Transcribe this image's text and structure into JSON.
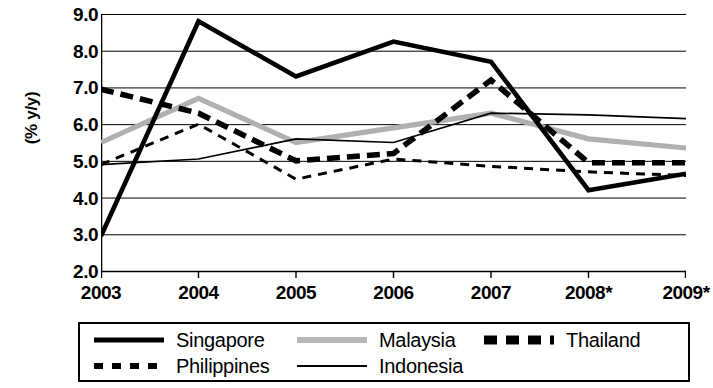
{
  "chart_data": {
    "type": "line",
    "title": "",
    "xlabel": "",
    "ylabel": "(% y/y)",
    "categories": [
      "2003",
      "2004",
      "2005",
      "2006",
      "2007",
      "2008*",
      "2009*"
    ],
    "ylim": [
      2.0,
      9.0
    ],
    "ytick_labels": [
      "9.0",
      "8.0",
      "7.0",
      "6.0",
      "5.0",
      "4.0",
      "3.0",
      "2.0"
    ],
    "ytick_values": [
      9.0,
      8.0,
      7.0,
      6.0,
      5.0,
      4.0,
      3.0,
      2.0
    ],
    "grid": true,
    "legend_position": "bottom",
    "series": [
      {
        "name": "Singapore",
        "style": "thick-solid",
        "color": "#000000",
        "values": [
          2.95,
          8.8,
          7.3,
          8.25,
          7.7,
          4.2,
          4.65
        ]
      },
      {
        "name": "Malaysia",
        "style": "thick-solid-gray",
        "color": "#b0b0b0",
        "values": [
          5.5,
          6.7,
          5.5,
          5.9,
          6.3,
          5.6,
          5.35
        ]
      },
      {
        "name": "Thailand",
        "style": "thick-dashed",
        "color": "#000000",
        "values": [
          6.95,
          6.3,
          5.0,
          5.2,
          7.2,
          4.95,
          4.95
        ]
      },
      {
        "name": "Philippines",
        "style": "thin-dashed",
        "color": "#000000",
        "values": [
          4.9,
          6.0,
          4.5,
          5.05,
          4.85,
          4.7,
          4.6
        ]
      },
      {
        "name": "Indonesia",
        "style": "thin-solid",
        "color": "#000000",
        "values": [
          4.9,
          5.05,
          5.6,
          5.5,
          6.3,
          6.25,
          6.15
        ]
      }
    ]
  },
  "legend": {
    "items": [
      {
        "label": "Singapore",
        "swatch": "thick-solid-black"
      },
      {
        "label": "Malaysia",
        "swatch": "thick-solid-gray"
      },
      {
        "label": "Thailand",
        "swatch": "thick-dashed-black"
      },
      {
        "label": "Philippines",
        "swatch": "thin-dashed-black"
      },
      {
        "label": "Indonesia",
        "swatch": "thin-solid-black"
      }
    ]
  }
}
